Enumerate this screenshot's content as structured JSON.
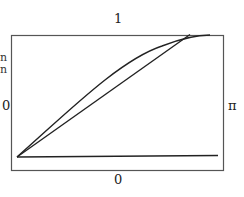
{
  "labels": {
    "top": "1",
    "bottom": "0",
    "left": "0",
    "right": "π",
    "left_partial_1": "n",
    "left_partial_2": "n"
  },
  "figure": {
    "box": {
      "x": 11,
      "y": 35,
      "width": 212,
      "height": 135
    },
    "stroke_color": "#222222",
    "box_color": "#555555",
    "curves": [
      {
        "name": "baseline",
        "type": "line",
        "from": [
          17,
          157
        ],
        "to": [
          218,
          155
        ]
      },
      {
        "name": "straight-line",
        "type": "line",
        "from": [
          17,
          157
        ],
        "to": [
          190,
          34
        ]
      },
      {
        "name": "concave-curve",
        "type": "curve",
        "from": [
          17,
          157
        ],
        "to": [
          208,
          34
        ]
      }
    ]
  }
}
